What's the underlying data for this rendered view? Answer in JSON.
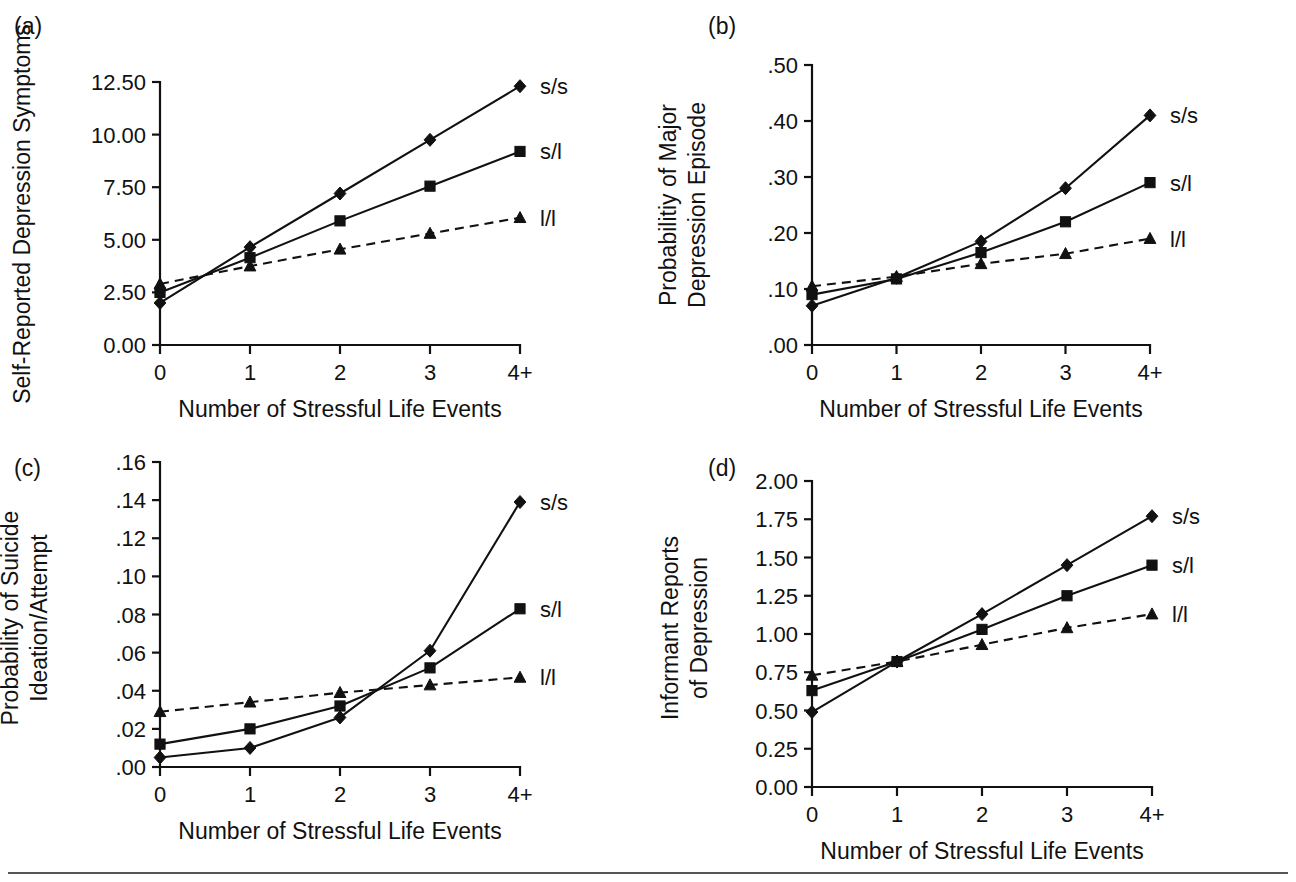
{
  "figure": {
    "background_color": "#ffffff",
    "ink_color": "#111111",
    "bottom_rule_color": "#555555",
    "shared_xlabel": "Number of Stressful Life Events",
    "shared_xticks": [
      "0",
      "1",
      "2",
      "3",
      "4+"
    ],
    "series_labels": [
      "s/s",
      "s/l",
      "l/l"
    ],
    "series_markers": [
      "diamond",
      "square",
      "triangle"
    ],
    "series_linestyles": [
      "solid",
      "solid",
      "dashed"
    ]
  },
  "chart_data": [
    {
      "panel": "a",
      "panel_letter": "(a)",
      "type": "line",
      "title": "",
      "xlabel": "Number of Stressful Life Events",
      "ylabel": "Self-Reported Depression Symptoms",
      "x": [
        0,
        1,
        2,
        3,
        4
      ],
      "categories": [
        "0",
        "1",
        "2",
        "3",
        "4+"
      ],
      "xticklabels": [
        "0",
        "1",
        "2",
        "3",
        "4+"
      ],
      "yticklabels": [
        "0.00",
        "2.50",
        "5.00",
        "7.50",
        "10.00",
        "12.50"
      ],
      "ytickvalues": [
        0,
        2.5,
        5.0,
        7.5,
        10.0,
        12.5
      ],
      "ylim": [
        0,
        12.5
      ],
      "xlim": [
        0,
        4
      ],
      "grid": false,
      "legend_position": "right-inline",
      "series": [
        {
          "name": "s/s",
          "marker": "diamond",
          "linestyle": "solid",
          "values": [
            2.0,
            4.65,
            7.2,
            9.75,
            12.3
          ]
        },
        {
          "name": "s/l",
          "marker": "square",
          "linestyle": "solid",
          "values": [
            2.5,
            4.15,
            5.9,
            7.55,
            9.2
          ]
        },
        {
          "name": "l/l",
          "marker": "triangle",
          "linestyle": "dashed",
          "values": [
            2.9,
            3.75,
            4.55,
            5.3,
            6.05
          ]
        }
      ]
    },
    {
      "panel": "b",
      "panel_letter": "(b)",
      "type": "line",
      "title": "",
      "xlabel": "Number of Stressful Life Events",
      "ylabel": "Probabilitiy of Major Depression Episode",
      "ylabel_lines": [
        "Probabilitiy of Major",
        "Depression Episode"
      ],
      "x": [
        0,
        1,
        2,
        3,
        4
      ],
      "categories": [
        "0",
        "1",
        "2",
        "3",
        "4+"
      ],
      "xticklabels": [
        "0",
        "1",
        "2",
        "3",
        "4+"
      ],
      "yticklabels": [
        ".00",
        ".10",
        ".20",
        ".30",
        ".40",
        ".50"
      ],
      "ytickvalues": [
        0.0,
        0.1,
        0.2,
        0.3,
        0.4,
        0.5
      ],
      "ylim": [
        0,
        0.5
      ],
      "xlim": [
        0,
        4
      ],
      "grid": false,
      "legend_position": "right-inline",
      "series": [
        {
          "name": "s/s",
          "marker": "diamond",
          "linestyle": "solid",
          "values": [
            0.07,
            0.12,
            0.185,
            0.28,
            0.41
          ]
        },
        {
          "name": "s/l",
          "marker": "square",
          "linestyle": "solid",
          "values": [
            0.09,
            0.118,
            0.165,
            0.22,
            0.29
          ]
        },
        {
          "name": "l/l",
          "marker": "triangle",
          "linestyle": "dashed",
          "values": [
            0.105,
            0.122,
            0.145,
            0.163,
            0.19
          ]
        }
      ]
    },
    {
      "panel": "c",
      "panel_letter": "(c)",
      "type": "line",
      "title": "",
      "xlabel": "Number of Stressful Life Events",
      "ylabel": "Probability of Suicide Ideation/Attempt",
      "ylabel_lines": [
        "Probability of Suicide",
        "Ideation/Attempt"
      ],
      "x": [
        0,
        1,
        2,
        3,
        4
      ],
      "categories": [
        "0",
        "1",
        "2",
        "3",
        "4+"
      ],
      "xticklabels": [
        "0",
        "1",
        "2",
        "3",
        "4+"
      ],
      "yticklabels": [
        ".00",
        ".02",
        ".04",
        ".06",
        ".08",
        ".10",
        ".12",
        ".14",
        ".16"
      ],
      "ytickvalues": [
        0.0,
        0.02,
        0.04,
        0.06,
        0.08,
        0.1,
        0.12,
        0.14,
        0.16
      ],
      "ylim": [
        0,
        0.16
      ],
      "xlim": [
        0,
        4
      ],
      "grid": false,
      "legend_position": "right-inline",
      "series": [
        {
          "name": "s/s",
          "marker": "diamond",
          "linestyle": "solid",
          "values": [
            0.005,
            0.01,
            0.026,
            0.061,
            0.139
          ]
        },
        {
          "name": "s/l",
          "marker": "square",
          "linestyle": "solid",
          "values": [
            0.012,
            0.02,
            0.032,
            0.052,
            0.083
          ]
        },
        {
          "name": "l/l",
          "marker": "triangle",
          "linestyle": "dashed",
          "values": [
            0.029,
            0.034,
            0.039,
            0.043,
            0.047
          ]
        }
      ]
    },
    {
      "panel": "d",
      "panel_letter": "(d)",
      "type": "line",
      "title": "",
      "xlabel": "Number of Stressful Life Events",
      "ylabel": "Informant Reports of Depression",
      "ylabel_lines": [
        "Informant Reports",
        "of Depression"
      ],
      "x": [
        0,
        1,
        2,
        3,
        4
      ],
      "categories": [
        "0",
        "1",
        "2",
        "3",
        "4+"
      ],
      "xticklabels": [
        "0",
        "1",
        "2",
        "3",
        "4+"
      ],
      "yticklabels": [
        "0.00",
        "0.25",
        "0.50",
        "0.75",
        "1.00",
        "1.25",
        "1.50",
        "1.75",
        "2.00"
      ],
      "ytickvalues": [
        0.0,
        0.25,
        0.5,
        0.75,
        1.0,
        1.25,
        1.5,
        1.75,
        2.0
      ],
      "ylim": [
        0,
        2.0
      ],
      "xlim": [
        0,
        4
      ],
      "grid": false,
      "legend_position": "right-inline",
      "series": [
        {
          "name": "s/s",
          "marker": "diamond",
          "linestyle": "solid",
          "values": [
            0.49,
            0.82,
            1.13,
            1.45,
            1.77
          ]
        },
        {
          "name": "s/l",
          "marker": "square",
          "linestyle": "solid",
          "values": [
            0.63,
            0.82,
            1.03,
            1.25,
            1.45
          ]
        },
        {
          "name": "l/l",
          "marker": "triangle",
          "linestyle": "dashed",
          "values": [
            0.73,
            0.82,
            0.93,
            1.04,
            1.13
          ]
        }
      ]
    }
  ]
}
